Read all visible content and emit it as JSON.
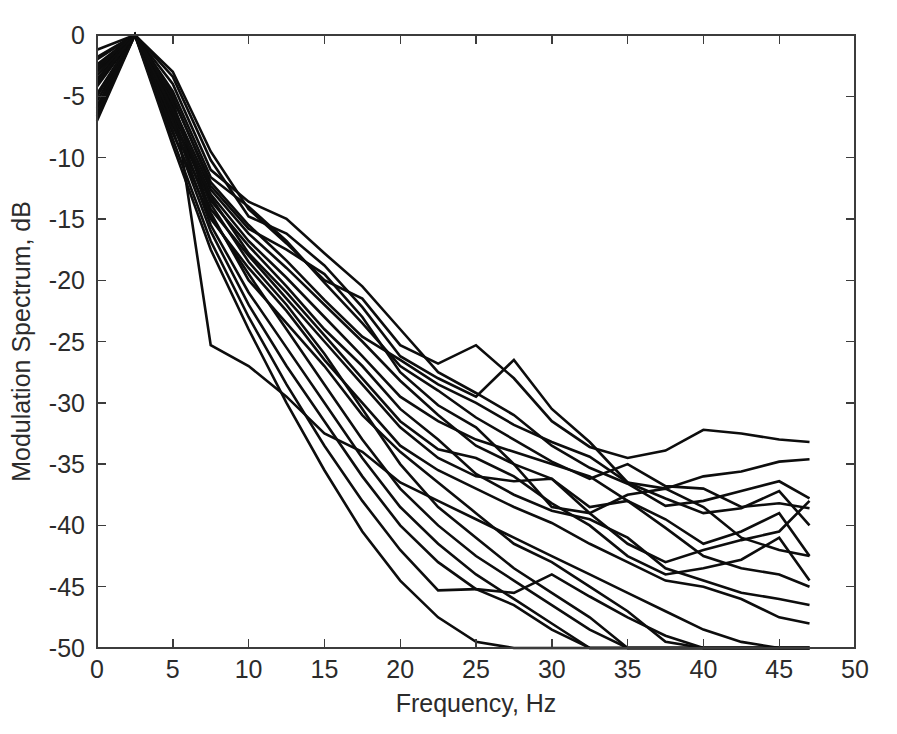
{
  "chart_data": {
    "type": "line",
    "title": "",
    "xlabel": "Frequency, Hz",
    "ylabel": "Modulation Spectrum, dB",
    "xlim": [
      0,
      50
    ],
    "ylim": [
      -50,
      0
    ],
    "xticks": [
      0,
      5,
      10,
      15,
      20,
      25,
      30,
      35,
      40,
      45,
      50
    ],
    "xtick_labels": [
      "0",
      "5",
      "10",
      "15",
      "20",
      "25",
      "30",
      "35",
      "40",
      "45",
      "50"
    ],
    "yticks": [
      0,
      -5,
      -10,
      -15,
      -20,
      -25,
      -30,
      -35,
      -40,
      -45,
      -50
    ],
    "ytick_labels": [
      "0",
      "-5",
      "-10",
      "-15",
      "-20",
      "-25",
      "-30",
      "-35",
      "-40",
      "-45",
      "-50"
    ],
    "grid": false,
    "legend": "none",
    "line_color": "#0d0d0d",
    "axis_color": "#3c3c3c",
    "background": "#ffffff",
    "x": [
      0,
      2.5,
      5,
      7.5,
      10,
      12.5,
      15,
      17.5,
      20,
      22.5,
      25,
      27.5,
      30,
      32.5,
      35,
      37.5,
      40,
      42.5,
      45,
      47
    ],
    "series": [
      {
        "name": "curve-01",
        "values": [
          -1.2,
          0,
          -3.0,
          -9.5,
          -14.2,
          -17.0,
          -20.0,
          -21.5,
          -25.3,
          -26.8,
          -25.3,
          -28.0,
          -31.5,
          -33.6,
          -34.5,
          -33.9,
          -32.2,
          -32.5,
          -33.0,
          -33.2
        ]
      },
      {
        "name": "curve-02",
        "values": [
          -1.8,
          0,
          -3.4,
          -10.2,
          -14.8,
          -16.2,
          -18.8,
          -22.2,
          -26.2,
          -28.0,
          -29.5,
          -26.5,
          -30.5,
          -33.2,
          -36.5,
          -37.0,
          -36.0,
          -35.6,
          -34.8,
          -34.6
        ]
      },
      {
        "name": "curve-03",
        "values": [
          -2.4,
          0,
          -4.0,
          -11.0,
          -13.6,
          -15.0,
          -17.8,
          -20.5,
          -24.0,
          -27.5,
          -29.2,
          -31.0,
          -33.5,
          -35.3,
          -36.6,
          -38.4,
          -38.0,
          -37.2,
          -36.4,
          -37.8
        ]
      },
      {
        "name": "curve-04",
        "values": [
          -3.0,
          0,
          -4.6,
          -11.6,
          -14.0,
          -16.8,
          -20.2,
          -23.5,
          -27.0,
          -29.0,
          -31.2,
          -33.0,
          -34.8,
          -36.2,
          -35.0,
          -36.8,
          -37.0,
          -38.5,
          -38.2,
          -38.6
        ]
      },
      {
        "name": "curve-05",
        "values": [
          -3.6,
          0,
          -5.2,
          -12.0,
          -15.5,
          -18.4,
          -21.6,
          -24.6,
          -26.5,
          -28.5,
          -30.0,
          -31.8,
          -33.2,
          -34.4,
          -36.5,
          -37.8,
          -39.0,
          -38.6,
          -37.2,
          -40.0
        ]
      },
      {
        "name": "curve-06",
        "values": [
          -4.2,
          0,
          -5.8,
          -12.6,
          -16.2,
          -19.0,
          -22.0,
          -25.0,
          -28.2,
          -31.0,
          -33.5,
          -35.0,
          -36.2,
          -38.5,
          -38.0,
          -39.5,
          -41.5,
          -40.5,
          -39.0,
          -42.5
        ]
      },
      {
        "name": "curve-07",
        "values": [
          -4.8,
          0,
          -6.3,
          -13.0,
          -16.8,
          -19.8,
          -23.0,
          -26.2,
          -29.5,
          -31.5,
          -33.0,
          -34.0,
          -35.0,
          -36.0,
          -38.0,
          -40.2,
          -42.5,
          -43.5,
          -44.0,
          -45.0
        ]
      },
      {
        "name": "curve-08",
        "values": [
          -5.4,
          0,
          -6.8,
          -13.5,
          -17.2,
          -20.5,
          -24.0,
          -27.0,
          -30.5,
          -33.0,
          -35.8,
          -37.5,
          -38.8,
          -39.5,
          -41.0,
          -43.5,
          -44.5,
          -45.5,
          -46.0,
          -46.5
        ]
      },
      {
        "name": "curve-09",
        "values": [
          -6.0,
          0,
          -7.4,
          -14.2,
          -18.0,
          -21.5,
          -25.0,
          -28.5,
          -32.0,
          -34.5,
          -36.0,
          -36.4,
          -36.2,
          -39.0,
          -41.5,
          -43.0,
          -42.0,
          -41.2,
          -40.5,
          -38.0
        ]
      },
      {
        "name": "curve-10",
        "values": [
          -6.6,
          0,
          -8.0,
          -15.0,
          -19.0,
          -22.5,
          -26.5,
          -30.0,
          -33.5,
          -35.5,
          -37.0,
          -38.5,
          -39.8,
          -41.5,
          -43.0,
          -44.5,
          -45.0,
          -46.0,
          -47.5,
          -48.0
        ]
      },
      {
        "name": "curve-11",
        "values": [
          -2.0,
          0,
          -4.8,
          -25.3,
          -27.0,
          -29.5,
          -32.5,
          -34.0,
          -36.5,
          -38.0,
          -39.5,
          -41.0,
          -42.5,
          -44.0,
          -45.5,
          -47.0,
          -48.5,
          -49.5,
          -50.0,
          -50.0
        ]
      },
      {
        "name": "curve-12",
        "values": [
          -2.8,
          0,
          -5.5,
          -14.5,
          -20.0,
          -23.5,
          -27.0,
          -31.0,
          -34.0,
          -36.5,
          -39.0,
          -41.5,
          -43.0,
          -45.0,
          -47.0,
          -49.5,
          -50.0,
          -50.0,
          -50.0,
          -50.0
        ]
      },
      {
        "name": "curve-13",
        "values": [
          -3.3,
          0,
          -6.0,
          -13.8,
          -18.5,
          -22.0,
          -26.0,
          -30.5,
          -35.0,
          -38.5,
          -41.0,
          -43.5,
          -45.5,
          -47.5,
          -50.0,
          -50.0,
          -50.0,
          -50.0,
          -50.0,
          -50.0
        ]
      },
      {
        "name": "curve-14",
        "values": [
          -4.0,
          0,
          -6.5,
          -14.8,
          -19.5,
          -24.0,
          -28.5,
          -33.0,
          -37.0,
          -40.0,
          -42.5,
          -44.5,
          -46.5,
          -48.5,
          -50.0,
          -50.0,
          -50.0,
          -50.0,
          -50.0,
          -50.0
        ]
      },
      {
        "name": "curve-15",
        "values": [
          -5.0,
          0,
          -7.0,
          -15.5,
          -21.0,
          -25.5,
          -30.0,
          -34.5,
          -38.5,
          -41.5,
          -44.0,
          -46.0,
          -48.0,
          -50.0,
          -50.0,
          -50.0,
          -50.0,
          -50.0,
          -50.0,
          -50.0
        ]
      },
      {
        "name": "curve-16",
        "values": [
          -5.8,
          0,
          -7.8,
          -16.0,
          -22.0,
          -27.0,
          -31.5,
          -36.0,
          -40.0,
          -43.0,
          -45.2,
          -45.5,
          -44.0,
          -45.8,
          -47.5,
          -49.0,
          -50.0,
          -50.0,
          -50.0,
          -50.0
        ]
      },
      {
        "name": "curve-17",
        "values": [
          -6.4,
          0,
          -8.5,
          -16.8,
          -23.0,
          -28.5,
          -33.5,
          -38.0,
          -42.0,
          -45.3,
          -45.2,
          -46.5,
          -48.5,
          -50.0,
          -50.0,
          -50.0,
          -50.0,
          -50.0,
          -50.0,
          -50.0
        ]
      },
      {
        "name": "curve-18",
        "values": [
          -7.0,
          0,
          -9.0,
          -17.5,
          -24.0,
          -30.0,
          -35.5,
          -40.5,
          -44.5,
          -47.5,
          -49.5,
          -50.0,
          -50.0,
          -50.0,
          -50.0,
          -50.0,
          -50.0,
          -50.0,
          -50.0,
          -50.0
        ]
      },
      {
        "name": "curve-19",
        "values": [
          -2.6,
          0,
          -5.0,
          -12.3,
          -15.8,
          -17.5,
          -19.5,
          -23.0,
          -27.5,
          -30.2,
          -32.0,
          -35.0,
          -38.5,
          -39.0,
          -37.5,
          -37.0,
          -38.5,
          -41.0,
          -42.0,
          -42.5
        ]
      },
      {
        "name": "curve-20",
        "values": [
          -3.8,
          0,
          -6.1,
          -13.2,
          -17.8,
          -21.0,
          -24.5,
          -28.0,
          -31.5,
          -33.8,
          -34.5,
          -36.0,
          -38.2,
          -40.0,
          -42.5,
          -44.0,
          -43.5,
          -42.8,
          -41.0,
          -44.5
        ]
      }
    ]
  }
}
